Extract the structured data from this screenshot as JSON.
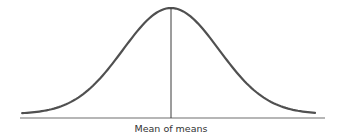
{
  "chart_data": {
    "type": "line",
    "title": "",
    "distribution": "normal",
    "mean": 0,
    "std_dev": 1,
    "x_range_sd": [
      -3.1,
      3.0
    ],
    "xlabel": "",
    "ylabel": "",
    "annotations": [
      {
        "text": "Mean of means",
        "x": 0,
        "marks": "vertical line at the peak"
      }
    ],
    "axes": {
      "x_axis_visible": true,
      "y_axis_visible": false,
      "ticks": false
    },
    "grid": false,
    "colors": {
      "curve": "#505050",
      "axis": "#6e6e6e",
      "mean_line": "#3a3a3a",
      "label": "#333333"
    }
  }
}
